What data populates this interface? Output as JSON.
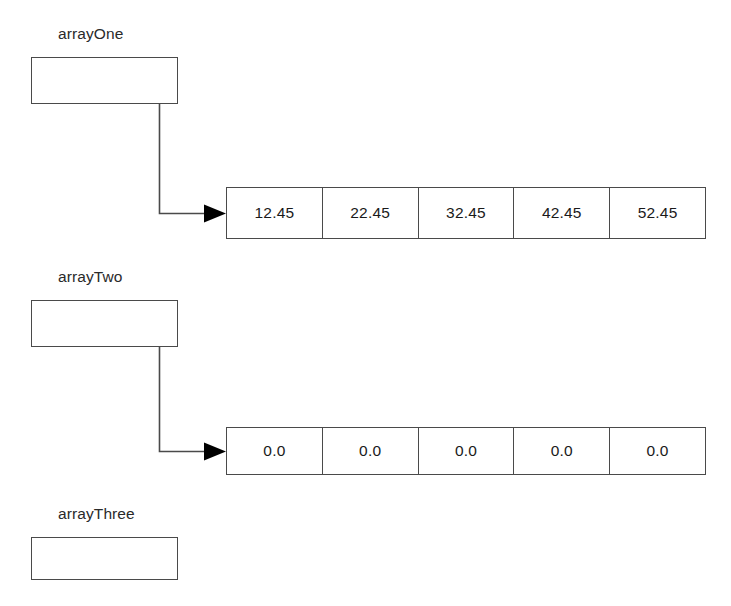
{
  "diagram": {
    "colors": {
      "background": "#ffffff",
      "line": "#4a4a4a",
      "arrow": "#000000",
      "text": "#1a1a1a"
    },
    "groups": [
      {
        "id": "array-one",
        "label": "arrayOne",
        "has_reference": true,
        "cells": [
          "12.45",
          "22.45",
          "32.45",
          "42.45",
          "52.45"
        ]
      },
      {
        "id": "array-two",
        "label": "arrayTwo",
        "has_reference": true,
        "cells": [
          "0.0",
          "0.0",
          "0.0",
          "0.0",
          "0.0"
        ]
      },
      {
        "id": "array-three",
        "label": "arrayThree",
        "has_reference": false,
        "cells": []
      }
    ]
  }
}
